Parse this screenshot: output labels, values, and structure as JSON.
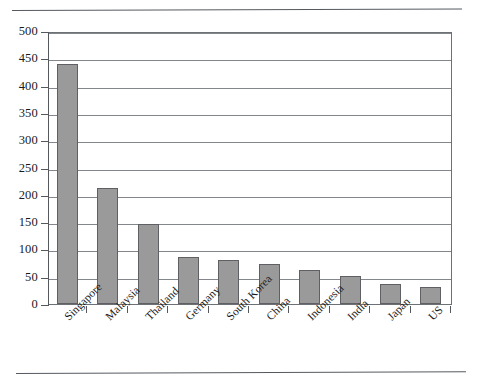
{
  "document": {
    "rules": [
      "top-rule",
      "bottom-rule"
    ]
  },
  "chart_data": {
    "type": "bar",
    "title": "",
    "xlabel": "",
    "ylabel": "",
    "ylim": [
      0,
      500
    ],
    "ytick_step": 50,
    "yticks": [
      0,
      50,
      100,
      150,
      200,
      250,
      300,
      350,
      400,
      450,
      500
    ],
    "ytick_labels": [
      "0",
      "50",
      "100",
      "150",
      "200",
      "250",
      "300",
      "350",
      "400",
      "450",
      "500"
    ],
    "grid": "horizontal",
    "legend": "none",
    "bar_color": "#9a9a9a",
    "bar_edge_color": "#5e6064",
    "categories": [
      "Singapore",
      "Malaysia",
      "Thailand",
      "Germany",
      "South Korea",
      "China",
      "Indonesia",
      "India",
      "Japan",
      "US"
    ],
    "values": [
      440,
      212,
      146,
      87,
      81,
      74,
      62,
      51,
      36,
      32
    ]
  }
}
